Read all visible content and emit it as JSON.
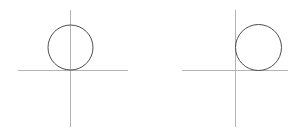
{
  "figure": {
    "background_color": "#ffffff",
    "width": 300,
    "height": 133,
    "axis_color": "#b3b3b3",
    "axis_stroke_width": 1,
    "circle_color": "#4d4d55",
    "circle_stroke_width": 1,
    "circle_fill": "none"
  },
  "panels": [
    {
      "id": "left",
      "label": "Circle centered on the y-axis, tangent to the x-axis from above",
      "origin": {
        "x": 70.5,
        "y": 70.5
      },
      "x_axis": {
        "x1": 18,
        "y1": 70.5,
        "x2": 128,
        "y2": 70.5,
        "label": "x-axis"
      },
      "y_axis": {
        "x1": 70.5,
        "y1": 10,
        "x2": 70.5,
        "y2": 127,
        "label": "y-axis"
      },
      "circle": {
        "cx": 70.5,
        "cy": 47.5,
        "r": 22.5,
        "diameter": 45,
        "tangent_to": [
          "x-axis"
        ],
        "bisected_by": [
          "y-axis"
        ],
        "label": "left-circle"
      }
    },
    {
      "id": "right",
      "label": "Circle tangent to both axes, lying in the first quadrant",
      "origin": {
        "x": 235.5,
        "y": 70.5
      },
      "x_axis": {
        "x1": 182,
        "y1": 70.5,
        "x2": 288,
        "y2": 70.5,
        "label": "x-axis"
      },
      "y_axis": {
        "x1": 235.5,
        "y1": 10,
        "x2": 235.5,
        "y2": 127,
        "label": "y-axis"
      },
      "circle": {
        "cx": 258.5,
        "cy": 47.5,
        "r": 23,
        "diameter": 46,
        "tangent_to": [
          "x-axis",
          "y-axis"
        ],
        "bisected_by": [],
        "label": "right-circle"
      }
    }
  ]
}
